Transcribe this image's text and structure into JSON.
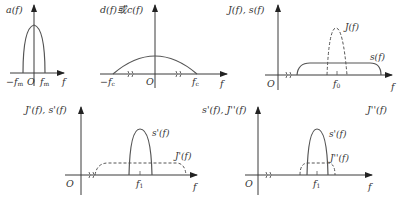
{
  "panels": [
    {
      "id": "a",
      "y_label": "a(f)",
      "x_label": "f",
      "origin_label": "O",
      "ticks": [
        "−f",
        "f"
      ],
      "tick_sub": "m",
      "curves": [
        {
          "name": "a(f)",
          "style": "solid",
          "shape": "narrow parabola"
        }
      ]
    },
    {
      "id": "d",
      "y_label": "d(f)或c(f)",
      "x_label": "f",
      "origin_label": "O",
      "ticks": [
        "−f",
        "f"
      ],
      "tick_sub": "c",
      "curves": [
        {
          "name": "d(f) or c(f)",
          "style": "solid",
          "shape": "wide arc"
        }
      ]
    },
    {
      "id": "J",
      "y_label": "J(f), s(f)",
      "x_label": "f",
      "origin_label": "O",
      "ticks": [
        "f"
      ],
      "tick_sub": "0",
      "curves": [
        {
          "name": "J(f)",
          "label": "J(f)",
          "style": "dashed",
          "shape": "narrow peak"
        },
        {
          "name": "s(f)",
          "label": "s(f)",
          "style": "solid",
          "shape": "wide flat plateau"
        }
      ]
    },
    {
      "id": "Jp",
      "y_label": "J'(f), s'(f)",
      "x_label": "f",
      "origin_label": "O",
      "ticks": [
        "f"
      ],
      "tick_sub": "1",
      "curves": [
        {
          "name": "s'(f)",
          "label": "s'(f)",
          "style": "solid",
          "shape": "narrow peak"
        },
        {
          "name": "J'(f)",
          "label": "J'(f)",
          "style": "dashed",
          "shape": "wide flat plateau"
        }
      ]
    },
    {
      "id": "Jpp",
      "y_label": "s'(f), J''(f)",
      "x_label": "f",
      "origin_label": "O",
      "ticks": [
        "f"
      ],
      "tick_sub": "1",
      "curves": [
        {
          "name": "s'(f)",
          "label": "s'(f)",
          "style": "solid",
          "shape": "narrow peak"
        },
        {
          "name": "J''(f)",
          "label": "J''(f)",
          "style": "dashed",
          "shape": "low narrow plateau"
        }
      ]
    }
  ],
  "corner_label": "J''(f)"
}
